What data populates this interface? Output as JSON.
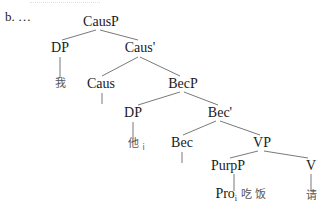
{
  "example_label": "b. …",
  "tree": {
    "nodes": {
      "causp": "CausP",
      "dp1": "DP",
      "caus_bar": "Caus'",
      "wo": "我",
      "caus": "Caus",
      "becp": "BecP",
      "dp2": "DP",
      "bec_bar": "Bec'",
      "ta": "他",
      "ta_index": "i",
      "bec": "Bec",
      "vp": "VP",
      "purpp": "PurpP",
      "v": "V",
      "pro": "Pro",
      "pro_index": "i",
      "chifan": "吃饭",
      "qing": "请"
    }
  }
}
